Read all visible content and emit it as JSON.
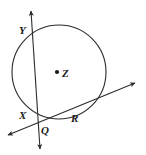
{
  "diagram": {
    "type": "euclidean-geometry",
    "background_color": "#ffffff",
    "stroke_color": "#2b2b2b",
    "label_color": "#1a1a1a",
    "circle": {
      "name": "circle-Z",
      "center_label": "Z",
      "center_x": 59,
      "center_y": 72,
      "radius": 47,
      "stroke_width": 1.1,
      "filled": false
    },
    "center_dot": {
      "name": "center-point-Z",
      "x": 57,
      "y": 72,
      "radius": 2.1
    },
    "lines": [
      {
        "name": "secant-line-YXQ",
        "description": "near-vertical double-headed line through Y and X, crossing Q",
        "x1": 31,
        "y1": 11,
        "x2": 40,
        "y2": 149,
        "arrow_start": true,
        "arrow_end": true,
        "stroke_width": 1.1
      },
      {
        "name": "secant-line-QR",
        "description": "double-headed line from lower-left through Q and R to upper-right",
        "x1": 8,
        "y1": 135,
        "x2": 135,
        "y2": 83,
        "arrow_start": true,
        "arrow_end": true,
        "stroke_width": 1.1
      }
    ],
    "labels": [
      {
        "id": "Y",
        "text": "Y",
        "name": "point-label-y",
        "x": 19,
        "y": 25
      },
      {
        "id": "Z",
        "text": "Z",
        "name": "point-label-z",
        "x": 62,
        "y": 68
      },
      {
        "id": "X",
        "text": "X",
        "name": "point-label-x",
        "x": 19,
        "y": 110
      },
      {
        "id": "R",
        "text": "R",
        "name": "point-label-r",
        "x": 71,
        "y": 113
      },
      {
        "id": "Q",
        "text": "Q",
        "name": "point-label-q",
        "x": 41,
        "y": 125
      }
    ]
  }
}
